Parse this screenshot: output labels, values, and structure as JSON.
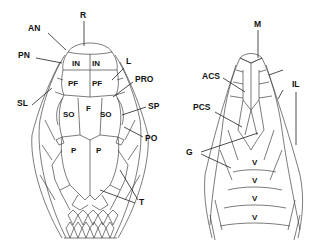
{
  "figure": {
    "dorsal_view": {
      "labels": {
        "R": "R",
        "AN": "AN",
        "PN": "PN",
        "L": "L",
        "PRO": "PRO",
        "SL": "SL",
        "SP": "SP",
        "PO": "PO",
        "T": "T"
      },
      "scales": {
        "IN_left": "IN",
        "IN_right": "IN",
        "PF_left": "PF",
        "PF_right": "PF",
        "F": "F",
        "SO_left": "SO",
        "SO_right": "SO",
        "P_left": "P",
        "P_right": "P"
      }
    },
    "ventral_view": {
      "labels": {
        "M": "M",
        "ACS": "ACS",
        "IL": "IL",
        "PCS": "PCS",
        "G": "G"
      },
      "scales": {
        "V1": "V",
        "V2": "V",
        "V3": "V",
        "V4": "V"
      }
    },
    "colors": {
      "line": "#444444",
      "text": "#111111",
      "background": "#ffffff"
    }
  }
}
